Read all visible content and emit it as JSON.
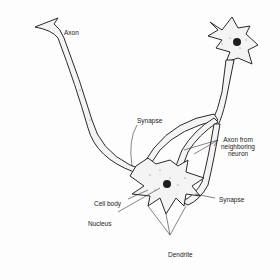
{
  "diagram": {
    "labels": {
      "axon": "Axon",
      "synapse_top": "Synapse",
      "axon_from_neighboring": [
        "Axon from",
        "neighboring",
        "neuron"
      ],
      "synapse_right": "Synapse",
      "cell_body": "Cell body",
      "nucleus": "Nucleus",
      "dendrite": "Dendrite"
    },
    "colors": {
      "outline": "#2a2a2a",
      "fill": "#f4f4f4",
      "stipple": "#555555",
      "nucleus": "#1e1e1e"
    }
  }
}
